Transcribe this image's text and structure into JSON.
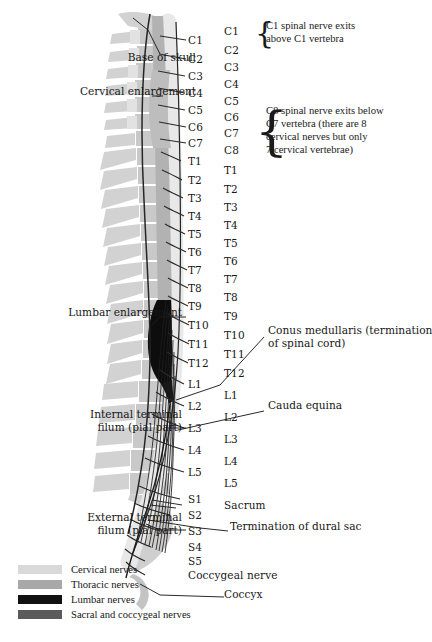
{
  "figure": {
    "background": "#ffffff"
  },
  "palette": {
    "cervical": "#d9d9d9",
    "thoracic": "#a8a8a8",
    "lumbar": "#111111",
    "sacral": "#5a5a5a",
    "bone": "#c9c9c9",
    "bone_light": "#dcdcdc",
    "cord": "#b0b0b0",
    "ink": "#171717"
  },
  "spinal_nerves": [
    {
      "label": "C1",
      "y": 40
    },
    {
      "label": "C2",
      "y": 59
    },
    {
      "label": "C3",
      "y": 76
    },
    {
      "label": "C4",
      "y": 93
    },
    {
      "label": "C5",
      "y": 110
    },
    {
      "label": "C6",
      "y": 127
    },
    {
      "label": "C7",
      "y": 143
    },
    {
      "label": "T1",
      "y": 161
    },
    {
      "label": "T2",
      "y": 180
    },
    {
      "label": "T3",
      "y": 198
    },
    {
      "label": "T4",
      "y": 216
    },
    {
      "label": "T5",
      "y": 234
    },
    {
      "label": "T6",
      "y": 252
    },
    {
      "label": "T7",
      "y": 270
    },
    {
      "label": "T8",
      "y": 288
    },
    {
      "label": "T9",
      "y": 306
    },
    {
      "label": "T10",
      "y": 325
    },
    {
      "label": "T11",
      "y": 344
    },
    {
      "label": "T12",
      "y": 363
    },
    {
      "label": "L1",
      "y": 384
    },
    {
      "label": "L2",
      "y": 406
    },
    {
      "label": "L3",
      "y": 428
    },
    {
      "label": "L4",
      "y": 450
    },
    {
      "label": "L5",
      "y": 472
    },
    {
      "label": "S1",
      "y": 499
    },
    {
      "label": "S2",
      "y": 515
    },
    {
      "label": "S3",
      "y": 531
    },
    {
      "label": "S4",
      "y": 547
    },
    {
      "label": "S5",
      "y": 561
    },
    {
      "label": "Coccygeal nerve",
      "y": 575
    }
  ],
  "vertebrae": [
    {
      "label": "C1",
      "y": 31
    },
    {
      "label": "C2",
      "y": 50
    },
    {
      "label": "C3",
      "y": 67
    },
    {
      "label": "C4",
      "y": 84
    },
    {
      "label": "C5",
      "y": 101
    },
    {
      "label": "C6",
      "y": 117
    },
    {
      "label": "C7",
      "y": 133
    },
    {
      "label": "C8",
      "y": 150
    },
    {
      "label": "T1",
      "y": 170
    },
    {
      "label": "T2",
      "y": 189
    },
    {
      "label": "T3",
      "y": 207
    },
    {
      "label": "T4",
      "y": 225
    },
    {
      "label": "T5",
      "y": 243
    },
    {
      "label": "T6",
      "y": 261
    },
    {
      "label": "T7",
      "y": 279
    },
    {
      "label": "T8",
      "y": 297
    },
    {
      "label": "T9",
      "y": 316
    },
    {
      "label": "T10",
      "y": 335
    },
    {
      "label": "T11",
      "y": 354
    },
    {
      "label": "T12",
      "y": 373
    },
    {
      "label": "L1",
      "y": 395
    },
    {
      "label": "L2",
      "y": 417
    },
    {
      "label": "L3",
      "y": 439
    },
    {
      "label": "L4",
      "y": 461
    },
    {
      "label": "L5",
      "y": 483
    },
    {
      "label": "Sacrum",
      "y": 505
    },
    {
      "label": "Coccyx",
      "y": 594
    }
  ],
  "left_labels": [
    {
      "name": "base-of-skull",
      "text": "Base of skull",
      "x": 86,
      "y": 58,
      "width": 110
    },
    {
      "name": "cervical-enlargement",
      "text": "Cervical enlargement",
      "x": 28,
      "y": 92,
      "width": 168
    },
    {
      "name": "lumbar-enlargement",
      "text": "Lumbar enlargement",
      "x": 18,
      "y": 313,
      "width": 164
    },
    {
      "name": "internal-terminal-filum",
      "text": "Internal terminal\nfilum (pial part)",
      "x": 56,
      "y": 415,
      "width": 126
    },
    {
      "name": "external-terminal-filum",
      "text": "External terminal\nfilum (pial part)",
      "x": 42,
      "y": 518,
      "width": 140
    }
  ],
  "right_labels": [
    {
      "name": "conus-medullaris",
      "text": "Conus medullaris (termination\nof spinal cord)",
      "x": 268,
      "y": 331
    },
    {
      "name": "cauda-equina",
      "text": "Cauda equina",
      "x": 268,
      "y": 406
    },
    {
      "name": "termination-of-dural-sac",
      "text": "Termination of dural sac",
      "x": 230,
      "y": 527
    }
  ],
  "braces": [
    {
      "name": "c1-note",
      "x": 255,
      "y": 20,
      "text": "C1 spinal nerve exits\nabove C1 vertebra",
      "lines": 2
    },
    {
      "name": "c8-note",
      "x": 255,
      "y": 105,
      "text": "C8 spinal nerve exits below\nC7 vertebra (there are 8\ncervical nerves but only\n7 cervical vertebrae)",
      "lines": 4
    }
  ],
  "legend": {
    "items": [
      {
        "label": "Cervical nerves",
        "color": "#d9d9d9"
      },
      {
        "label": "Thoracic nerves",
        "color": "#a8a8a8"
      },
      {
        "label": "Lumbar nerves",
        "color": "#111111"
      },
      {
        "label": "Sacral and coccygeal nerves",
        "color": "#5a5a5a"
      }
    ]
  }
}
